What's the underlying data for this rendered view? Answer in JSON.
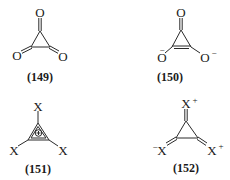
{
  "structures": [
    {
      "id": "149",
      "label": "(149)",
      "name": "cyclopropanetrione",
      "atoms": {
        "top": "O",
        "left": "O",
        "right": "O"
      },
      "charges": {
        "top": "",
        "left": "",
        "right": ""
      }
    },
    {
      "id": "150",
      "label": "(150)",
      "name": "deltate dianion",
      "atoms": {
        "top": "O",
        "left": "O",
        "right": "O"
      },
      "charges": {
        "top": "",
        "left": "−",
        "right": "−"
      }
    },
    {
      "id": "151",
      "label": "(151)",
      "name": "trisubstituted cyclopropenium cation",
      "atoms": {
        "top": "X",
        "left": "X",
        "right": "X"
      },
      "ring_charge": "+"
    },
    {
      "id": "152",
      "label": "(152)",
      "name": "resonance form with exocyclic double bonds",
      "atoms": {
        "top": "X",
        "left": "X",
        "right": "X"
      },
      "charges": {
        "top": "+",
        "left": "−",
        "right": "+"
      }
    }
  ]
}
